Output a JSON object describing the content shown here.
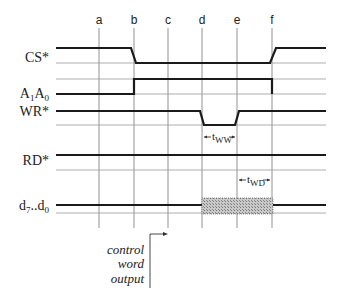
{
  "diagram": {
    "columns": [
      {
        "label": "a",
        "x": 99
      },
      {
        "label": "b",
        "x": 134
      },
      {
        "label": "c",
        "x": 168
      },
      {
        "label": "d",
        "x": 202
      },
      {
        "label": "e",
        "x": 237
      },
      {
        "label": "f",
        "x": 272
      }
    ],
    "signals": [
      {
        "name": "CS*",
        "label": "CS*"
      },
      {
        "name": "A1A0",
        "label_main1": "A",
        "label_sub1": "1",
        "label_main2": "A",
        "label_sub2": "0"
      },
      {
        "name": "WR*",
        "label": "WR*"
      },
      {
        "name": "RD*",
        "label": "RD*"
      },
      {
        "name": "d7..d0",
        "label_main1": "d",
        "label_sub1": "7",
        "label_mid": "..d",
        "label_sub2": "0"
      }
    ],
    "timing_labels": {
      "tww_main": "t",
      "tww_sub": "WW",
      "twd_main": "t",
      "twd_sub": "WD"
    },
    "annotation": {
      "line1": "control",
      "line2": "word",
      "line3": "output"
    },
    "colors": {
      "signal": "#1a1a1a",
      "grid": "#777777",
      "baseline": "#9a9a9a",
      "hatch": "#b0b0b0"
    }
  }
}
